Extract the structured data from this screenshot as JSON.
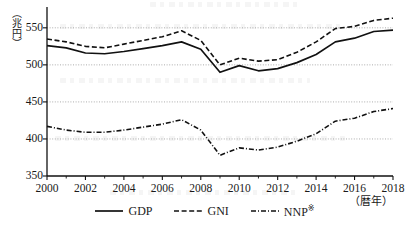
{
  "chart_data": {
    "type": "line",
    "title": "",
    "xlabel": "（暦年）",
    "ylabel": "（兆円）",
    "x": [
      2000,
      2001,
      2002,
      2003,
      2004,
      2005,
      2006,
      2007,
      2008,
      2009,
      2010,
      2011,
      2012,
      2013,
      2014,
      2015,
      2016,
      2017,
      2018
    ],
    "xlim": [
      2000,
      2018
    ],
    "ylim": [
      350,
      570
    ],
    "yticks": [
      350,
      400,
      450,
      500,
      550
    ],
    "xticks": [
      2000,
      2002,
      2004,
      2006,
      2008,
      2010,
      2012,
      2014,
      2016,
      2018
    ],
    "xtick_labels": [
      "2000",
      "2002",
      "2004",
      "2006",
      "2008",
      "2010",
      "2012",
      "2014",
      "2016",
      "2018"
    ],
    "ytick_labels": [
      "350",
      "400",
      "450",
      "500",
      "550"
    ],
    "minor_xticks": [
      2001,
      2003,
      2005,
      2007,
      2009,
      2011,
      2013,
      2015,
      2017
    ],
    "grid": true,
    "grid_axis": "y",
    "legend_position": "bottom",
    "series": [
      {
        "name": "GDP",
        "style": "solid",
        "color": "#111111",
        "values": [
          526,
          523,
          516,
          515,
          518,
          522,
          526,
          531,
          521,
          490,
          499,
          492,
          495,
          503,
          514,
          531,
          536,
          545,
          547
        ]
      },
      {
        "name": "GNI",
        "style": "dashed",
        "color": "#111111",
        "values": [
          535,
          531,
          525,
          523,
          528,
          533,
          538,
          546,
          533,
          500,
          509,
          505,
          507,
          517,
          531,
          549,
          552,
          560,
          563
        ]
      },
      {
        "name": "NNP",
        "style": "dashdot",
        "color": "#111111",
        "values": [
          417,
          412,
          409,
          409,
          412,
          416,
          420,
          426,
          412,
          378,
          388,
          385,
          389,
          397,
          407,
          424,
          428,
          437,
          441
        ]
      }
    ]
  },
  "legend": {
    "items": [
      {
        "label": "GDP",
        "mark": "",
        "style": "solid"
      },
      {
        "label": "GNI",
        "mark": "",
        "style": "dashed"
      },
      {
        "label": "NNP",
        "mark": "※",
        "style": "dashdot"
      }
    ]
  },
  "axes": {
    "y_unit": "（兆円）",
    "x_unit": "（暦年）"
  }
}
